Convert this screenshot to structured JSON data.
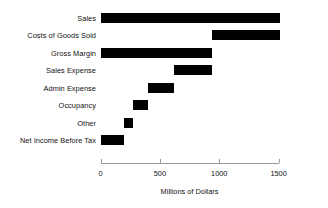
{
  "chart_data": {
    "type": "bar",
    "subtype": "waterfall",
    "title": "",
    "xlabel": "Millions of Dollars",
    "ylabel": "",
    "orientation": "horizontal",
    "grid": false,
    "legend": null,
    "xlim": [
      0,
      1600
    ],
    "xticks": [
      0,
      500,
      1000,
      1500
    ],
    "xtick_labels": [
      "0",
      "500",
      "1000",
      "1500"
    ],
    "bar_color": "#000000",
    "axis_color": "#9a9a9a",
    "categories": [
      "Sales",
      "Costs of Goods Sold",
      "Gross Margin",
      "Sales Expense",
      "Admin Expense",
      "Occupancy",
      "Other",
      "Net Income Before Tax"
    ],
    "bars": [
      {
        "label": "Sales",
        "start": 0,
        "end": 1510,
        "value": 1510
      },
      {
        "label": "Costs of Goods Sold",
        "start": 940,
        "end": 1510,
        "value": 570
      },
      {
        "label": "Gross Margin",
        "start": 0,
        "end": 940,
        "value": 940
      },
      {
        "label": "Sales Expense",
        "start": 620,
        "end": 940,
        "value": 320
      },
      {
        "label": "Admin Expense",
        "start": 400,
        "end": 620,
        "value": 220
      },
      {
        "label": "Occupancy",
        "start": 270,
        "end": 400,
        "value": 130
      },
      {
        "label": "Other",
        "start": 200,
        "end": 270,
        "value": 70
      },
      {
        "label": "Net Income Before Tax",
        "start": 0,
        "end": 200,
        "value": 200
      }
    ]
  }
}
